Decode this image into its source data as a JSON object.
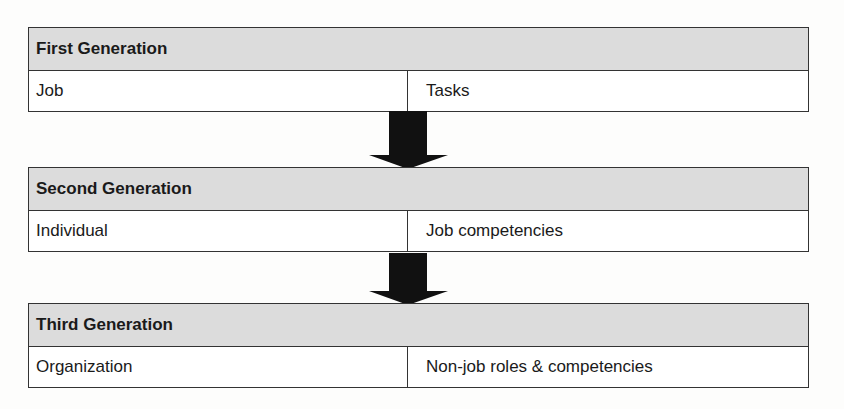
{
  "generations": [
    {
      "title": "First Generation",
      "left": "Job",
      "right": "Tasks"
    },
    {
      "title": "Second Generation",
      "left": "Individual",
      "right": "Job competencies"
    },
    {
      "title": "Third Generation",
      "left": "Organization",
      "right": "Non-job roles & competencies"
    }
  ],
  "colors": {
    "header_bg": "#dcdcdc",
    "border": "#333333",
    "arrow": "#111111"
  }
}
